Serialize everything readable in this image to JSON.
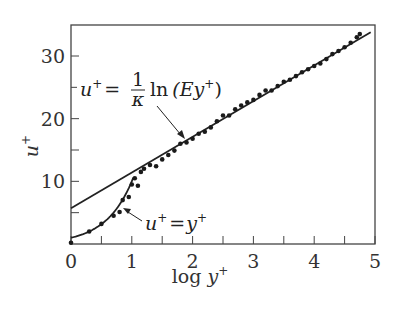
{
  "chart_data": {
    "type": "scatter",
    "title": "",
    "xlabel": "log y+",
    "ylabel": "u+",
    "xlim": [
      0,
      5
    ],
    "ylim": [
      0,
      35
    ],
    "grid": false,
    "legend": null,
    "x_ticks": [
      0,
      1,
      2,
      3,
      4,
      5
    ],
    "x_minor_ticks": [
      0.5,
      1.5,
      2.5,
      3.5,
      4.5
    ],
    "y_ticks": [
      10,
      20,
      30
    ],
    "y_minor_ticks": [
      5,
      15,
      25
    ],
    "x_tick_labels": [
      "0",
      "1",
      "2",
      "3",
      "4",
      "5"
    ],
    "y_tick_labels": [
      "10",
      "20",
      "30"
    ],
    "series": [
      {
        "name": "log-law",
        "kind": "line",
        "equation": "u+ = (1/κ) ln(E y+)",
        "x": [
          0,
          4.93
        ],
        "y": [
          5.7,
          33.8
        ]
      },
      {
        "name": "viscous-sublayer",
        "kind": "line",
        "equation": "u+ = y+",
        "x": [
          0,
          0.2,
          0.4,
          0.6,
          0.8,
          0.9,
          1.0,
          1.05
        ],
        "y": [
          1.0,
          1.58,
          2.51,
          3.98,
          6.31,
          7.94,
          10.0,
          11.2
        ]
      },
      {
        "name": "experimental data",
        "kind": "scatter",
        "x": [
          0.0,
          0.3,
          0.5,
          0.7,
          0.8,
          0.85,
          0.95,
          1.0,
          1.05,
          1.1,
          1.15,
          1.2,
          1.3,
          1.4,
          1.5,
          1.6,
          1.7,
          1.8,
          1.9,
          2.0,
          2.1,
          2.2,
          2.3,
          2.4,
          2.5,
          2.6,
          2.7,
          2.8,
          2.9,
          3.0,
          3.1,
          3.2,
          3.3,
          3.4,
          3.5,
          3.6,
          3.7,
          3.8,
          3.9,
          4.0,
          4.1,
          4.2,
          4.3,
          4.4,
          4.5,
          4.6,
          4.7,
          4.75
        ],
        "y": [
          0.2,
          2.0,
          3.2,
          4.5,
          5.1,
          7.0,
          7.5,
          9.5,
          10.5,
          9.3,
          11.5,
          12.0,
          12.6,
          12.4,
          13.5,
          14.2,
          14.9,
          16.0,
          16.2,
          16.8,
          17.6,
          17.9,
          18.6,
          19.6,
          20.5,
          20.5,
          21.5,
          22.1,
          22.6,
          23.0,
          23.8,
          24.5,
          24.5,
          25.2,
          25.9,
          26.2,
          26.8,
          27.4,
          27.9,
          28.4,
          28.8,
          29.5,
          30.3,
          30.8,
          31.4,
          32.1,
          33.0,
          33.5
        ]
      }
    ],
    "annotations": [
      {
        "text": "u+ = (1/κ) ln(E y+)",
        "points_to": "log-law line",
        "at": [
          1.35,
          16.7
        ]
      },
      {
        "text": "u+ = y+",
        "points_to": "viscous-sublayer curve",
        "at": [
          0.85,
          6.6
        ]
      }
    ]
  },
  "labels": {
    "xlabel_main": "log ",
    "xlabel_var": "y",
    "xlabel_sup": "+",
    "ylabel_var": "u",
    "ylabel_sup": "+",
    "ann1_lhs": "u",
    "ann1_sup": "+",
    "ann1_eq": "=",
    "ann1_num": "1",
    "ann1_den": "κ",
    "ann1_rhs_ln": "ln",
    "ann1_rhs_arg": "(Ey",
    "ann1_rhs_sup": "+",
    "ann1_rhs_close": ")",
    "ann2_lhs": "u",
    "ann2_sup": "+",
    "ann2_eq": "=",
    "ann2_rhs": "y",
    "ann2_rhs_sup": "+"
  }
}
